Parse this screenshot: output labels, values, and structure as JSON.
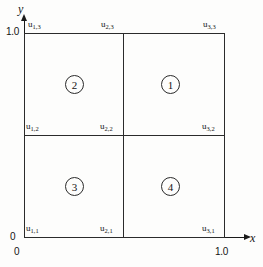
{
  "figure": {
    "type": "finite-element-mesh-diagram",
    "axes": {
      "x_label": "x",
      "y_label": "y",
      "x_origin_tick": "0",
      "x_max_tick": "1.0",
      "y_origin_tick": "0",
      "y_max_tick": "1.0"
    },
    "nodes": [
      {
        "id": "u11",
        "base": "u",
        "sub": "1,1",
        "x": 0.0,
        "y": 0.0
      },
      {
        "id": "u21",
        "base": "u",
        "sub": "2,1",
        "x": 0.5,
        "y": 0.0
      },
      {
        "id": "u31",
        "base": "u",
        "sub": "3,1",
        "x": 1.0,
        "y": 0.0
      },
      {
        "id": "u12",
        "base": "u",
        "sub": "1,2",
        "x": 0.0,
        "y": 0.5
      },
      {
        "id": "u22",
        "base": "u",
        "sub": "2,2",
        "x": 0.5,
        "y": 0.5
      },
      {
        "id": "u32",
        "base": "u",
        "sub": "3,2",
        "x": 1.0,
        "y": 0.5
      },
      {
        "id": "u13",
        "base": "u",
        "sub": "1,3",
        "x": 0.0,
        "y": 1.0
      },
      {
        "id": "u23",
        "base": "u",
        "sub": "2,3",
        "x": 0.5,
        "y": 1.0
      },
      {
        "id": "u33",
        "base": "u",
        "sub": "3,3",
        "x": 1.0,
        "y": 1.0
      }
    ],
    "elements": [
      {
        "id": "element-1",
        "label": "1",
        "quadrant": "upper-right"
      },
      {
        "id": "element-2",
        "label": "2",
        "quadrant": "upper-left"
      },
      {
        "id": "element-3",
        "label": "3",
        "quadrant": "lower-left"
      },
      {
        "id": "element-4",
        "label": "4",
        "quadrant": "lower-right"
      }
    ],
    "colors": {
      "line": "#2b2b2b",
      "axis": "#1a1a1a",
      "text": "#141414",
      "background": "#fdfdfc"
    }
  }
}
